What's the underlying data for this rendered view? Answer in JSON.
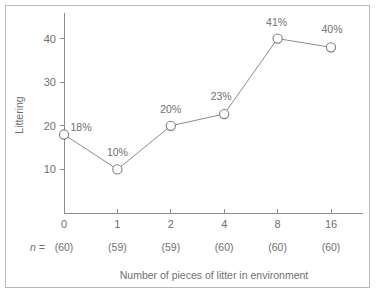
{
  "figure": {
    "border_color": "#b9b9b9",
    "background": "#ffffff",
    "axis_color": "#8d8d8d",
    "text_color": "#6f6f6f"
  },
  "labels": {
    "n_prefix": "n ="
  },
  "chart_data": {
    "type": "line",
    "title": "",
    "subtitle": "",
    "xlabel": "Number of pieces of litter in environment",
    "ylabel": "Littering",
    "categories": [
      "0",
      "1",
      "2",
      "4",
      "8",
      "16"
    ],
    "values": [
      18,
      10,
      20,
      22.7,
      40,
      38
    ],
    "point_labels": [
      "18%",
      "10%",
      "20%",
      "23%",
      "41%",
      "40%"
    ],
    "group_sizes": [
      "(60)",
      "(59)",
      "(59)",
      "(60)",
      "(60)",
      "(60)"
    ],
    "ylim": [
      0,
      45
    ],
    "yticks": [
      "40",
      "30",
      "20",
      "10"
    ],
    "ytick_values": [
      40,
      30,
      20,
      10
    ],
    "grid": false,
    "legend": "none",
    "marker": "open-circle",
    "series": [
      {
        "name": "Littering",
        "values": [
          18,
          10,
          20,
          22.7,
          40,
          38
        ]
      }
    ]
  }
}
